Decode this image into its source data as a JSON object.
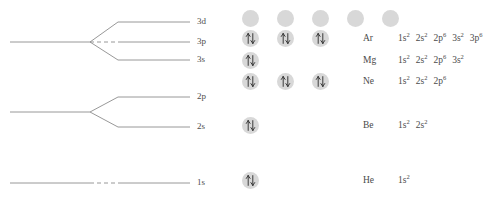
{
  "diagram": {
    "levels": [
      {
        "id": "3d",
        "label": "3d",
        "label_x": 197,
        "label_y": 17,
        "y_end": 22,
        "y_start": 42,
        "split_x": 90,
        "branch_x": 118,
        "dashed": false
      },
      {
        "id": "3p",
        "label": "3p",
        "label_x": 197,
        "label_y": 37,
        "y_end": 42,
        "y_start": 42,
        "split_x": 90,
        "branch_x": 118,
        "dashed": true
      },
      {
        "id": "3s",
        "label": "3s",
        "label_x": 197,
        "label_y": 55,
        "y_end": 60,
        "y_start": 42,
        "split_x": 90,
        "branch_x": 118,
        "dashed": false
      },
      {
        "id": "2p",
        "label": "2p",
        "label_x": 197,
        "label_y": 92,
        "y_end": 97,
        "y_start": 112,
        "split_x": 90,
        "branch_x": 118,
        "dashed": false
      },
      {
        "id": "2s",
        "label": "2s",
        "label_x": 197,
        "label_y": 122,
        "y_end": 127,
        "y_start": 112,
        "split_x": 90,
        "branch_x": 118,
        "dashed": false
      },
      {
        "id": "1s",
        "label": "1s",
        "label_x": 197,
        "label_y": 178,
        "y_end": 183,
        "y_start": 183,
        "split_x": 90,
        "branch_x": 118,
        "dashed": true
      }
    ],
    "line_color": "#8c8c8c",
    "left_x": 10,
    "right_x": 190
  },
  "orbitals": {
    "circle_color": "#d8d8d8",
    "arrow_color": "#3a3a3a",
    "columns_x": [
      12,
      47,
      82,
      117,
      152
    ],
    "symbol_x": 133,
    "config_x": 168,
    "rows": [
      {
        "id": "row-3d",
        "shell": "3d",
        "y": 10,
        "filled": 0,
        "circles": 5,
        "symbol": "",
        "config": []
      },
      {
        "id": "row-ar",
        "shell": "3p",
        "y": 30,
        "filled": 3,
        "circles": 3,
        "symbol": "Ar",
        "config": [
          {
            "orbital": "1s",
            "electrons": "2"
          },
          {
            "orbital": "2s",
            "electrons": "2"
          },
          {
            "orbital": "2p",
            "electrons": "6"
          },
          {
            "orbital": "3s",
            "electrons": "2"
          },
          {
            "orbital": "3p",
            "electrons": "6"
          }
        ]
      },
      {
        "id": "row-mg",
        "shell": "3s",
        "y": 52,
        "filled": 1,
        "circles": 1,
        "symbol": "Mg",
        "config": [
          {
            "orbital": "1s",
            "electrons": "2"
          },
          {
            "orbital": "2s",
            "electrons": "2"
          },
          {
            "orbital": "2p",
            "electrons": "6"
          },
          {
            "orbital": "3s",
            "electrons": "2"
          }
        ]
      },
      {
        "id": "row-ne",
        "shell": "2p",
        "y": 73,
        "filled": 3,
        "circles": 3,
        "symbol": "Ne",
        "config": [
          {
            "orbital": "1s",
            "electrons": "2"
          },
          {
            "orbital": "2s",
            "electrons": "2"
          },
          {
            "orbital": "2p",
            "electrons": "6"
          }
        ]
      },
      {
        "id": "row-be",
        "shell": "2s",
        "y": 117,
        "filled": 1,
        "circles": 1,
        "symbol": "Be",
        "config": [
          {
            "orbital": "1s",
            "electrons": "2"
          },
          {
            "orbital": "2s",
            "electrons": "2"
          }
        ]
      },
      {
        "id": "row-he",
        "shell": "1s",
        "y": 172,
        "filled": 1,
        "circles": 1,
        "symbol": "He",
        "config": [
          {
            "orbital": "1s",
            "electrons": "2"
          }
        ]
      }
    ]
  }
}
